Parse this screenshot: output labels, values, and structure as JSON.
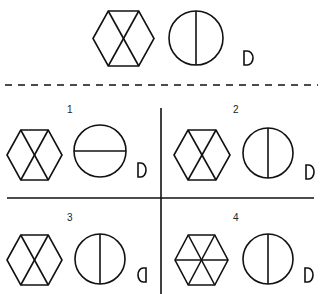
{
  "puzzle": {
    "question": {
      "hexagon": {
        "pattern": "x-cross",
        "cx": 123.5,
        "cy": 38.5,
        "w": 61,
        "h": 55
      },
      "circle": {
        "divider": "vertical",
        "cx": 196,
        "cy": 38,
        "r": 27
      },
      "d_shape": {
        "orientation": "right",
        "x": 244,
        "y": 51,
        "w": 9,
        "h": 14
      }
    },
    "separator": {
      "style": "dashed",
      "y": 85,
      "x1": 5,
      "x2": 318
    },
    "grid": {
      "vline_x": 161,
      "vline_y1": 108,
      "vline_y2": 294,
      "hline_y": 198,
      "hline_x1": 7,
      "hline_x2": 314
    },
    "options": [
      {
        "label": "1",
        "label_pos": {
          "x": 67,
          "y": 113
        },
        "hexagon": {
          "pattern": "x-cross",
          "cx": 34.5,
          "cy": 155,
          "w": 55,
          "h": 50
        },
        "circle": {
          "divider": "horizontal",
          "cx": 100,
          "cy": 151,
          "r": 26
        },
        "d_shape": {
          "orientation": "right",
          "x": 138,
          "y": 163,
          "w": 8,
          "h": 14
        }
      },
      {
        "label": "2",
        "label_pos": {
          "x": 233,
          "y": 113
        },
        "hexagon": {
          "pattern": "x-cross",
          "cx": 202,
          "cy": 155,
          "w": 56,
          "h": 50
        },
        "circle": {
          "divider": "vertical",
          "cx": 268,
          "cy": 153,
          "r": 25
        },
        "d_shape": {
          "orientation": "right",
          "x": 306,
          "y": 165,
          "w": 8,
          "h": 14
        }
      },
      {
        "label": "3",
        "label_pos": {
          "x": 67,
          "y": 221
        },
        "hexagon": {
          "pattern": "x-cross",
          "cx": 34.5,
          "cy": 260,
          "w": 55,
          "h": 50
        },
        "circle": {
          "divider": "vertical",
          "cx": 100,
          "cy": 259,
          "r": 25
        },
        "d_shape": {
          "orientation": "left",
          "x": 138,
          "y": 268,
          "w": 8,
          "h": 14
        }
      },
      {
        "label": "4",
        "label_pos": {
          "x": 233,
          "y": 221
        },
        "hexagon": {
          "pattern": "six-spokes",
          "cx": 201.5,
          "cy": 260,
          "w": 53,
          "h": 50
        },
        "circle": {
          "divider": "vertical",
          "cx": 268,
          "cy": 259,
          "r": 25
        },
        "d_shape": {
          "orientation": "right",
          "x": 305,
          "y": 268,
          "w": 8,
          "h": 14
        }
      }
    ]
  }
}
